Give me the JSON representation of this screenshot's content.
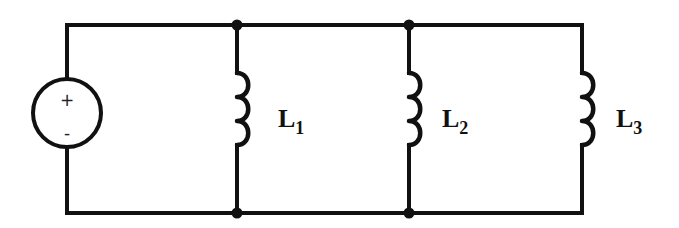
{
  "diagram": {
    "type": "circuit-schematic",
    "colors": {
      "stroke": "#111111",
      "background": "#ffffff"
    },
    "source": {
      "kind": "voltage-source",
      "positive_symbol": "+",
      "negative_symbol": "-"
    },
    "inductors": [
      {
        "letter": "L",
        "subscript": "1"
      },
      {
        "letter": "L",
        "subscript": "2"
      },
      {
        "letter": "L",
        "subscript": "3"
      }
    ],
    "connection": "parallel",
    "junction_count": 4
  }
}
